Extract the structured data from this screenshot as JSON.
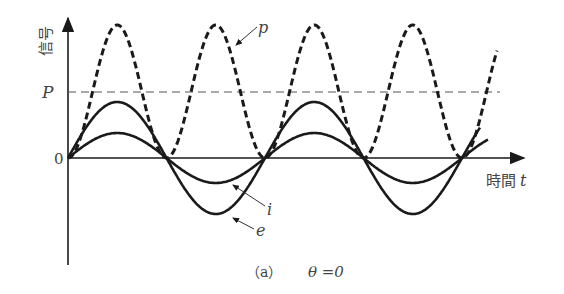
{
  "figure": {
    "caption_prefix": "（a）",
    "caption_condition": "θ =0",
    "y_axis_label": "信号",
    "x_axis_label": "時間",
    "x_axis_var": "t",
    "origin_label": "0",
    "level_label": "P",
    "curve_labels": {
      "p": "p",
      "i": "i",
      "e": "e"
    }
  },
  "chart_data": {
    "type": "line",
    "xlabel": "時間 t",
    "ylabel": "信号",
    "series": [
      {
        "name": "e",
        "style": "solid",
        "description": "voltage, sinusoid, larger amplitude",
        "relative_amplitude": 1.0,
        "phase_deg": 0,
        "cycles_shown": 2.1
      },
      {
        "name": "i",
        "style": "solid",
        "description": "current, sinusoid in phase with e, smaller amplitude",
        "relative_amplitude": 0.45,
        "phase_deg": 0,
        "cycles_shown": 2.1
      },
      {
        "name": "p",
        "style": "dashed",
        "description": "instantaneous power p = e·i, always ≥ 0, twice the frequency, oscillates between 0 and 2P",
        "min": 0,
        "max": "2P",
        "mean": "P",
        "cycles_shown": 4.2
      }
    ],
    "reference_lines": [
      {
        "label": "P",
        "style": "dashed",
        "meaning": "average power"
      }
    ],
    "grid": false
  },
  "colors": {
    "ink": "#1a1a1a",
    "text": "#444444",
    "background": "#ffffff"
  }
}
